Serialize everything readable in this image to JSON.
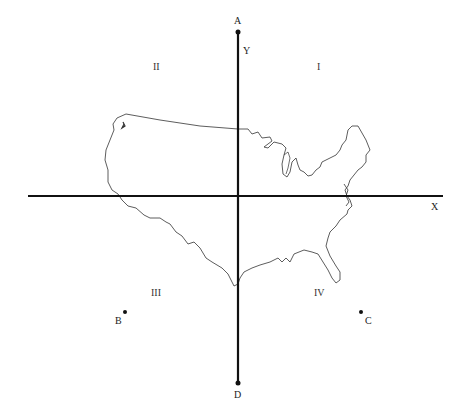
{
  "diagram": {
    "title": "",
    "axes": {
      "x_label": "X",
      "y_label": "Y",
      "color": "#111111"
    },
    "points": {
      "A": {
        "label": "A"
      },
      "B": {
        "label": "B"
      },
      "C": {
        "label": "C"
      },
      "D": {
        "label": "D"
      }
    },
    "quadrants": {
      "I": "I",
      "II": "II",
      "III": "III",
      "IV": "IV"
    },
    "map": {
      "subject": "outline of contiguous United States",
      "stroke_color": "#333333"
    }
  }
}
